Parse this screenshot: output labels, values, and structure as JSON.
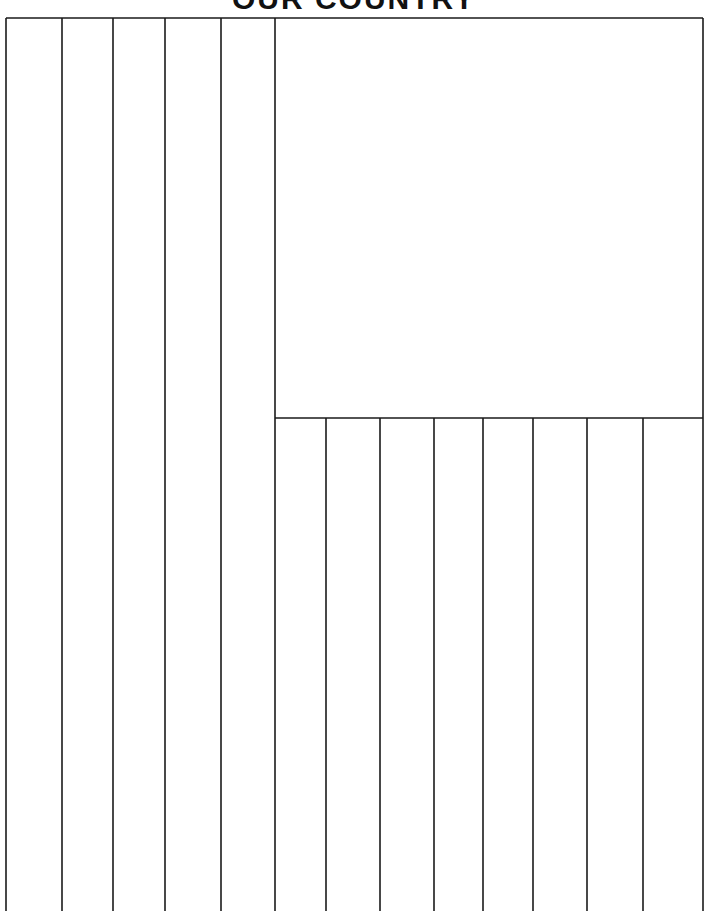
{
  "title": "OUR COUNTRY",
  "flag": {
    "outline": {
      "left": 6,
      "top": 18,
      "right": 703
    },
    "canton": {
      "left": 274,
      "top": 18,
      "right": 703,
      "bottom": 418
    },
    "left_stripe_lines_x": [
      62,
      113,
      165,
      221
    ],
    "lower_stripe_lines_x": [
      326,
      380,
      434,
      483,
      533,
      587,
      643
    ],
    "stroke_color": "#1a1a1a"
  }
}
